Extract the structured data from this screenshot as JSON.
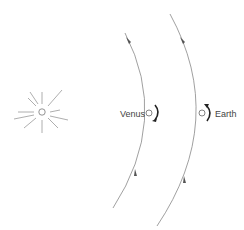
{
  "diagram": {
    "sun": {
      "icon": "sun-icon",
      "x": 42,
      "y": 112
    },
    "planets": [
      {
        "label": "Venus",
        "x": 149,
        "y": 113,
        "label_side": "left",
        "rotation": "clockwise"
      },
      {
        "label": "Earth",
        "x": 202,
        "y": 113,
        "label_side": "right",
        "rotation": "counterclockwise"
      }
    ],
    "orbit_direction": "up"
  },
  "colors": {
    "line": "#777777",
    "text": "#444444"
  }
}
